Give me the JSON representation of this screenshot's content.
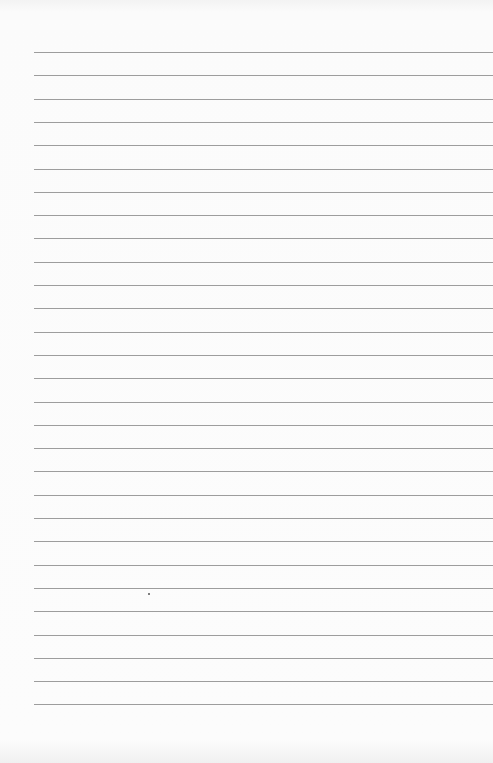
{
  "page": {
    "type": "lined-paper",
    "line_count": 29,
    "first_line_y": 52,
    "line_spacing": 23.3,
    "line_left": 34,
    "line_color": "#8c8c8c",
    "marks": [
      {
        "x": 148,
        "y": 593
      }
    ]
  }
}
